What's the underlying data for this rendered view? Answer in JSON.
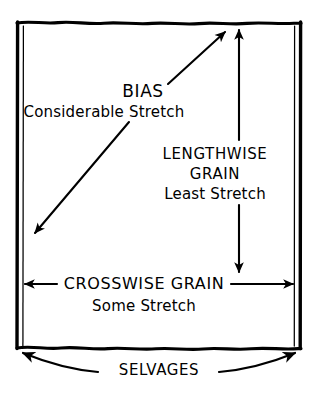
{
  "diagram": {
    "background_color": "#ffffff",
    "ink_color": "#000000",
    "style": "hand-drawn / comic line art"
  },
  "fabric": {
    "shape_name": "fabric-rectangle",
    "top_edge": "raw-wavy-edge",
    "bottom_edge": "raw-wavy-edge",
    "left_edge": "selvage-double-line",
    "right_edge": "selvage-double-line"
  },
  "labels": {
    "bias": {
      "title": "BIAS",
      "subtitle": "Considerable Stretch",
      "arrow": "bias-diagonal-arrow",
      "direction": "diagonal 45 degrees, double-headed"
    },
    "lengthwise": {
      "title_line1": "LENGTHWISE",
      "title_line2": "GRAIN",
      "subtitle": "Least Stretch",
      "arrow": "lengthwise-vertical-arrow",
      "direction": "vertical, double-headed"
    },
    "crosswise": {
      "title": "CROSSWISE GRAIN",
      "subtitle": "Some Stretch",
      "arrow": "crosswise-horizontal-arrow",
      "direction": "horizontal, double-headed"
    },
    "selvages": {
      "title": "SELVAGES",
      "arrow": "selvages-curved-arrow",
      "direction": "curved, double-headed, spans bottom width"
    }
  }
}
